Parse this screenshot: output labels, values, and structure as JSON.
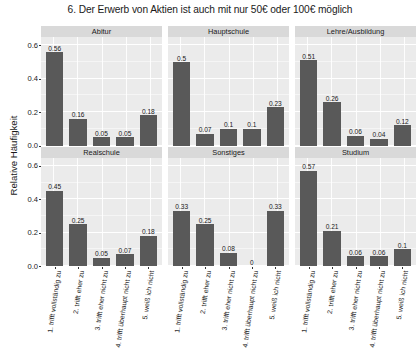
{
  "chart_data": {
    "type": "bar",
    "title": "6. Der Erwerb von Aktien ist auch mit nur 50€ oder 100€ möglich",
    "xlabel": "",
    "ylabel": "Relative Häufigkeit",
    "ylim": [
      0,
      0.65
    ],
    "yticks": [
      "0.0",
      "0.2",
      "0.4",
      "0.6"
    ],
    "ytick_values": [
      0,
      0.2,
      0.4,
      0.6
    ],
    "grid": true,
    "legend": "none",
    "facet_layout": "2 rows x 3 columns",
    "categories": [
      "1. trifft vollständig zu",
      "2. trifft eher zu",
      "3. trifft eher nicht zu",
      "4. trifft überhaupt nicht zu",
      "5. weiß ich nicht"
    ],
    "panels": [
      {
        "name": "Abitur",
        "values": [
          0.56,
          0.16,
          0.05,
          0.05,
          0.18
        ],
        "labels": [
          "0.56",
          "0.16",
          "0.05",
          "0.05",
          "0.18"
        ]
      },
      {
        "name": "Hauptschule",
        "values": [
          0.5,
          0.07,
          0.1,
          0.1,
          0.23
        ],
        "labels": [
          "0.5",
          "0.07",
          "0.1",
          "0.1",
          "0.23"
        ]
      },
      {
        "name": "Lehre/Ausbildung",
        "values": [
          0.51,
          0.26,
          0.06,
          0.04,
          0.12
        ],
        "labels": [
          "0.51",
          "0.26",
          "0.06",
          "0.04",
          "0.12"
        ]
      },
      {
        "name": "Realschule",
        "values": [
          0.45,
          0.25,
          0.05,
          0.07,
          0.18
        ],
        "labels": [
          "0.45",
          "0.25",
          "0.05",
          "0.07",
          "0.18"
        ]
      },
      {
        "name": "Sonstiges",
        "values": [
          0.33,
          0.25,
          0.08,
          0,
          0.33
        ],
        "labels": [
          "0.33",
          "0.25",
          "0.08",
          "0",
          "0.33"
        ]
      },
      {
        "name": "Studium",
        "values": [
          0.57,
          0.21,
          0.06,
          0.06,
          0.1
        ],
        "labels": [
          "0.57",
          "0.21",
          "0.06",
          "0.06",
          "0.1"
        ]
      }
    ],
    "colors": {
      "bar_fill": "#595959",
      "panel_background": "#ebebeb",
      "strip_background": "#d9d9d9",
      "gridline": "#ffffff",
      "figure_background": "#ffffff",
      "text": "#1a1a1a"
    }
  }
}
